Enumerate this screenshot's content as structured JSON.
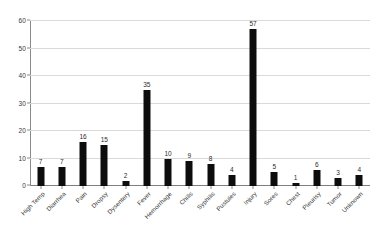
{
  "chart_data": {
    "type": "bar",
    "title": "",
    "subtitle": "",
    "xlabel": "",
    "ylabel": "",
    "ylim": [
      0,
      60
    ],
    "yticks": [
      0,
      10,
      20,
      30,
      40,
      50,
      60
    ],
    "grid": true,
    "legend": false,
    "bar_color": "#0d0d0d",
    "grid_color": "#d9d9d9",
    "axis_color": "#8a8a8a",
    "categories": [
      "High Temp",
      "Diarrhea",
      "Pain",
      "Dropsy",
      "Dysentery",
      "Fever",
      "Hemorrhage",
      "Chills",
      "Syphilis",
      "Pustules",
      "Injury",
      "Sores",
      "Chest",
      "Pleurisy",
      "Tumor",
      "Unknown"
    ],
    "values": [
      7,
      7,
      16,
      15,
      2,
      35,
      10,
      9,
      8,
      4,
      57,
      5,
      1,
      6,
      3,
      4
    ]
  }
}
